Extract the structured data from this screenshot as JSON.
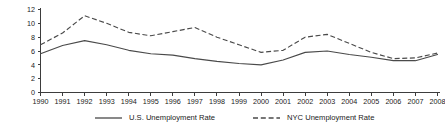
{
  "chart_data": {
    "type": "line",
    "title": "",
    "subtitle": "",
    "xlabel": "",
    "ylabel": "",
    "xlim": [
      1990,
      2008
    ],
    "ylim": [
      0,
      12
    ],
    "yticks": [
      0,
      2,
      4,
      6,
      8,
      10,
      12
    ],
    "grid": false,
    "legend_position": "bottom-center",
    "categories": [
      "1990",
      "1991",
      "1992",
      "1993",
      "1994",
      "1995",
      "1996",
      "1997",
      "1998",
      "1999",
      "2000",
      "2001",
      "2002",
      "2003",
      "2004",
      "2005",
      "2006",
      "2007",
      "2008"
    ],
    "x_tick_labels": [
      "1990",
      "1991",
      "1992",
      "1993",
      "1994",
      "1995",
      "1996",
      "1997",
      "1998",
      "1999",
      "2000",
      "2001",
      "2002",
      "2003",
      "2004",
      "2005",
      "2006",
      "2007",
      "2008"
    ],
    "y_tick_labels": [
      "0",
      "2",
      "4",
      "6",
      "8",
      "10",
      "12"
    ],
    "series": [
      {
        "name": "U.S. Unemployment Rate",
        "style": "solid",
        "color": "#4a4a4a",
        "values": [
          5.6,
          6.8,
          7.5,
          6.9,
          6.1,
          5.6,
          5.4,
          4.9,
          4.5,
          4.2,
          4.0,
          4.7,
          5.8,
          6.0,
          5.5,
          5.1,
          4.6,
          4.6,
          5.5
        ]
      },
      {
        "name": "NYC Unemployment Rate",
        "style": "dashed",
        "color": "#4a4a4a",
        "values": [
          6.9,
          8.6,
          11.1,
          10.0,
          8.7,
          8.2,
          8.8,
          9.4,
          8.0,
          6.9,
          5.8,
          6.1,
          8.0,
          8.4,
          7.1,
          5.8,
          4.9,
          5.0,
          5.7
        ]
      }
    ]
  },
  "legend": {
    "items": [
      {
        "label": "U.S. Unemployment Rate",
        "style": "solid"
      },
      {
        "label": "NYC Unemployment Rate",
        "style": "dashed"
      }
    ]
  },
  "colors": {
    "line": "#4a4a4a",
    "axis": "#3d3d3d",
    "text": "#1a1a1a",
    "background": "#ffffff"
  }
}
